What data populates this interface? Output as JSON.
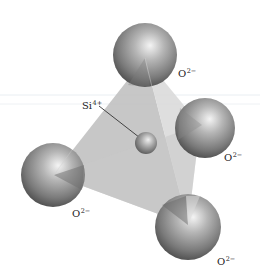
{
  "figure": {
    "central_ion": {
      "symbol": "Si",
      "charge": "4+",
      "center": [
        146,
        143
      ],
      "radius": 11
    },
    "corner_ions": [
      {
        "id": "top",
        "symbol": "O",
        "charge": "2−",
        "center": [
          145,
          55
        ],
        "radius": 32,
        "label_pos": [
          178,
          68
        ]
      },
      {
        "id": "right",
        "symbol": "O",
        "charge": "2−",
        "center": [
          205,
          128
        ],
        "radius": 30,
        "label_pos": [
          224,
          152
        ]
      },
      {
        "id": "left",
        "symbol": "O",
        "charge": "2−",
        "center": [
          53,
          175
        ],
        "radius": 32,
        "label_pos": [
          72,
          208
        ]
      },
      {
        "id": "bottom",
        "symbol": "O",
        "charge": "2−",
        "center": [
          188,
          227
        ],
        "radius": 33,
        "label_pos": [
          217,
          256
        ]
      }
    ],
    "si_label_pos": [
      82,
      100
    ],
    "colors": {
      "sphere_light": "#e6e6e6",
      "sphere_mid": "#9a9a9a",
      "sphere_dark": "#4a4a4a",
      "face_front": "#b8b8b8",
      "face_side": "#d2d2d2",
      "leader_line": "#333333",
      "label": "#222222"
    }
  }
}
